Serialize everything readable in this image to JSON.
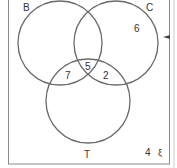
{
  "diagram": {
    "type": "venn",
    "universal_symbol": "ξ",
    "sets": [
      {
        "name": "B",
        "label": "B"
      },
      {
        "name": "C",
        "label": "C"
      },
      {
        "name": "T",
        "label": "T"
      }
    ],
    "regions": {
      "C_only": "6",
      "B_T_only": "7",
      "B_C_T": "5",
      "C_T_only": "2",
      "outside": "4"
    },
    "colors": {
      "line": "#6a6a6a",
      "text": "#333333",
      "frame": "#8a8a8a"
    }
  }
}
